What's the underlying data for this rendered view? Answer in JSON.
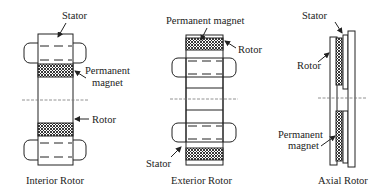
{
  "diagrams": {
    "interior": {
      "title": "Interior Rotor",
      "labels": {
        "stator": "Stator",
        "magnet_line1": "Permanent",
        "magnet_line2": "magnet",
        "rotor": "Rotor"
      }
    },
    "exterior": {
      "title": "Exterior Rotor",
      "labels": {
        "magnet": "Permanent magnet",
        "rotor": "Rotor",
        "stator": "Stator"
      }
    },
    "axial": {
      "title": "Axial Rotor",
      "labels": {
        "stator": "Stator",
        "rotor": "Rotor",
        "magnet_line1": "Permanent",
        "magnet_line2": "magnet"
      }
    }
  },
  "colors": {
    "line": "#222222",
    "background": "#ffffff",
    "axis": "#777777"
  }
}
